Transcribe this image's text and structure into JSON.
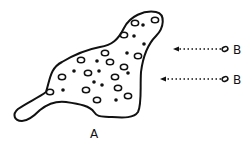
{
  "diagram": {
    "body_label": "A",
    "particle_label": "B",
    "colors": {
      "ink": "#111111",
      "background": "#ffffff"
    },
    "outline_path": "M22,121 C14,121 12,114 18,109 C28,102 38,98 46,92 C50,80 50,68 62,62 C72,56 84,50 100,47 C112,45 118,40 124,28 C130,16 144,10 156,12 C166,14 164,28 156,36 C148,44 143,56 141,72 C140,88 142,104 138,112 C134,118 124,118 112,117 C102,116 98,118 94,112 C90,106 80,104 66,102 C58,101 50,102 40,110 C34,116 28,121 22,121 Z",
    "rings": [
      {
        "x": 135,
        "y": 23
      },
      {
        "x": 155,
        "y": 20
      },
      {
        "x": 124,
        "y": 35
      },
      {
        "x": 105,
        "y": 53
      },
      {
        "x": 138,
        "y": 56
      },
      {
        "x": 81,
        "y": 60
      },
      {
        "x": 110,
        "y": 62
      },
      {
        "x": 62,
        "y": 77
      },
      {
        "x": 88,
        "y": 73
      },
      {
        "x": 124,
        "y": 67
      },
      {
        "x": 115,
        "y": 77
      },
      {
        "x": 50,
        "y": 92
      },
      {
        "x": 86,
        "y": 90
      },
      {
        "x": 118,
        "y": 88
      },
      {
        "x": 97,
        "y": 100
      },
      {
        "x": 128,
        "y": 96
      }
    ],
    "dots": [
      {
        "x": 143,
        "y": 25
      },
      {
        "x": 134,
        "y": 36
      },
      {
        "x": 144,
        "y": 44
      },
      {
        "x": 97,
        "y": 61
      },
      {
        "x": 127,
        "y": 53
      },
      {
        "x": 74,
        "y": 71
      },
      {
        "x": 99,
        "y": 71
      },
      {
        "x": 128,
        "y": 73
      },
      {
        "x": 94,
        "y": 82
      },
      {
        "x": 102,
        "y": 85
      },
      {
        "x": 63,
        "y": 90
      },
      {
        "x": 116,
        "y": 100
      }
    ],
    "arrows": [
      {
        "x1": 221,
        "y": 49,
        "x2": 173,
        "label_x": 233,
        "ring_x": 225
      },
      {
        "x1": 221,
        "y": 79,
        "x2": 160,
        "label_x": 233,
        "ring_x": 225
      }
    ],
    "label_a_pos": {
      "x": 94,
      "y": 138
    }
  }
}
